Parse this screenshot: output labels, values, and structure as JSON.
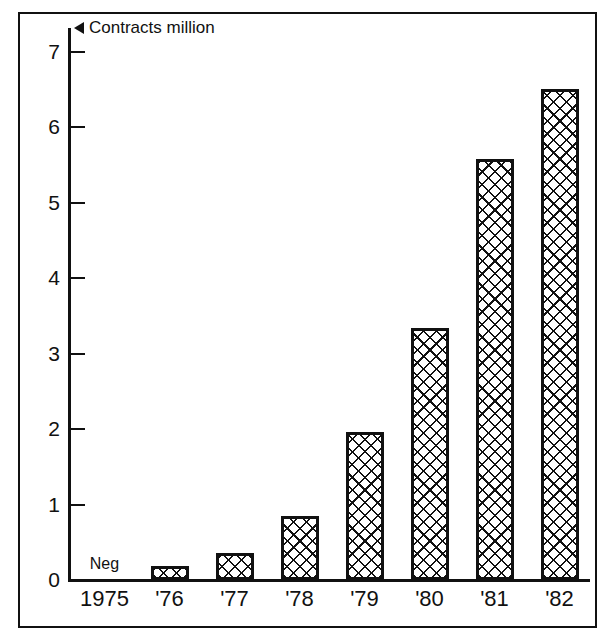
{
  "chart_data": {
    "type": "bar",
    "title": "",
    "subtitle": "",
    "xlabel": "",
    "ylabel": "Contracts million",
    "unit_marker": "left-triangle",
    "categories": [
      "1975",
      "'76",
      "'77",
      "'78",
      "'79",
      "'80",
      "'81",
      "'82"
    ],
    "values": [
      0,
      0.19,
      0.36,
      0.85,
      1.96,
      3.34,
      5.58,
      6.51
    ],
    "point_labels": [
      "Neg",
      "",
      "",
      "",
      "",
      "",
      "",
      ""
    ],
    "ylim": [
      0,
      7
    ],
    "ytick_labels": [
      "0",
      "1",
      "2",
      "3",
      "4",
      "5",
      "6",
      "7"
    ],
    "ytick_values": [
      0,
      1,
      2,
      3,
      4,
      5,
      6,
      7
    ],
    "grid": false,
    "legend": false,
    "legend_position": "none",
    "bar_fill": "crosshatch-diagonal",
    "bar_edge_color": "#111111",
    "background_color": "#ffffff",
    "frame": true
  },
  "axis": {
    "unit_label": "Contracts million"
  }
}
